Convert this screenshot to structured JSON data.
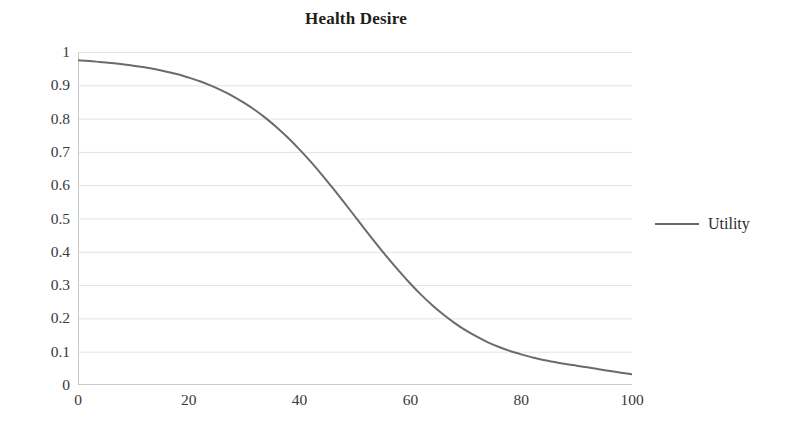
{
  "chart_data": {
    "type": "line",
    "title": "Health Desire",
    "subtitle": "",
    "xlabel": "",
    "ylabel": "",
    "xlim": [
      0,
      100
    ],
    "ylim": [
      0,
      1
    ],
    "xticks": [
      0,
      20,
      40,
      60,
      80,
      100
    ],
    "yticks": [
      0,
      0.1,
      0.2,
      0.3,
      0.4,
      0.5,
      0.6,
      0.7,
      0.8,
      0.9,
      1
    ],
    "xtick_labels": [
      "0",
      "20",
      "40",
      "60",
      "80",
      "100"
    ],
    "ytick_labels": [
      "0",
      "0.1",
      "0.2",
      "0.3",
      "0.4",
      "0.5",
      "0.6",
      "0.7",
      "0.8",
      "0.9",
      "1"
    ],
    "grid": {
      "horizontal": true,
      "vertical": false,
      "color": "#e2e2e2"
    },
    "legend": {
      "position": "right",
      "entries": [
        {
          "name": "Utility",
          "color": "#6b6b6b",
          "marker": "line"
        }
      ]
    },
    "series": [
      {
        "name": "Utility",
        "color": "#6b6b6b",
        "line_width": 2,
        "x": [
          0,
          2,
          4,
          6,
          8,
          10,
          12,
          14,
          16,
          18,
          20,
          22,
          24,
          26,
          28,
          30,
          32,
          34,
          36,
          38,
          40,
          42,
          44,
          46,
          48,
          50,
          52,
          54,
          56,
          58,
          60,
          62,
          64,
          66,
          68,
          70,
          72,
          74,
          76,
          78,
          80,
          82,
          84,
          86,
          88,
          90,
          92,
          94,
          96,
          98,
          100
        ],
        "values": [
          0.975,
          0.973,
          0.97,
          0.967,
          0.963,
          0.959,
          0.954,
          0.948,
          0.941,
          0.933,
          0.923,
          0.912,
          0.899,
          0.884,
          0.867,
          0.847,
          0.825,
          0.8,
          0.772,
          0.741,
          0.707,
          0.671,
          0.632,
          0.591,
          0.549,
          0.506,
          0.463,
          0.421,
          0.38,
          0.341,
          0.304,
          0.27,
          0.239,
          0.211,
          0.186,
          0.164,
          0.145,
          0.128,
          0.114,
          0.102,
          0.092,
          0.083,
          0.075,
          0.069,
          0.063,
          0.058,
          0.053,
          0.047,
          0.042,
          0.037,
          0.032
        ]
      }
    ],
    "annotations": []
  },
  "legend": {
    "utility_label": "Utility"
  }
}
